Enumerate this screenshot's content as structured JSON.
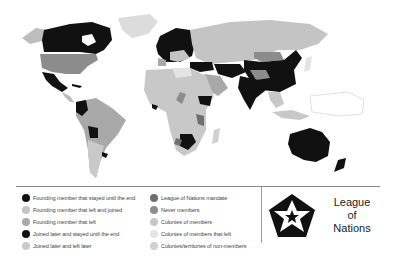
{
  "map": {
    "title": "League of Nations membership world map",
    "colors": {
      "founding_stayed": "#111111",
      "founding_left_rejoined": "#c4c4c4",
      "founding_left": "#a9a9a9",
      "joined_later_stayed": "#111111",
      "joined_later_left": "#c9c9c9",
      "mandate": "#6f6f6f",
      "never_members": "#8c8c8c",
      "colonies_members": "#c8c8c8",
      "colonies_members_left": "#e4e4e4",
      "colonies_non_members": "#d0d0d0"
    }
  },
  "legend": {
    "left": [
      {
        "label": "Founding member that stayed until the end",
        "color": "#111111"
      },
      {
        "label": "Founding member that left and joined",
        "color": "#c4c4c4"
      },
      {
        "label": "Founding member that left",
        "color": "#a9a9a9"
      },
      {
        "label": "Joined later and stayed until the end",
        "color": "#111111"
      },
      {
        "label": "Joined later and left later",
        "color": "#c9c9c9"
      }
    ],
    "right": [
      {
        "label": "League of Nations mandate",
        "color": "#6f6f6f"
      },
      {
        "label": "Never members",
        "color": "#8c8c8c"
      },
      {
        "label": "Colonies of members",
        "color": "#c8c8c8"
      },
      {
        "label": "Colonies of members that left",
        "color": "#e4e4e4"
      },
      {
        "label": "Colonies/territories of non-members",
        "color": "#d0d0d0"
      }
    ]
  },
  "logo": {
    "line1": "League",
    "line2": "of",
    "line3": "Nations"
  }
}
